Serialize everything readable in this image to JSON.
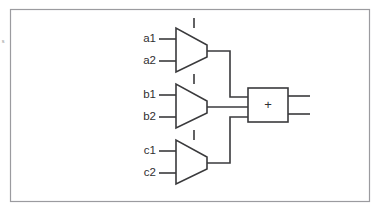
{
  "figure": {
    "kind": "digital-logic-schematic",
    "frame": {
      "border_color": "#9b9b9f",
      "background_color": "#ffffff",
      "x": 10,
      "y": 9,
      "width": 360,
      "height": 193
    },
    "line_color": "#3a3a3c",
    "margin_text": "s",
    "multiplexers": [
      {
        "name": "mux-a",
        "inputs": [
          {
            "label": "a1"
          },
          {
            "label": "a2"
          }
        ],
        "select_label": "",
        "output_label": ""
      },
      {
        "name": "mux-b",
        "inputs": [
          {
            "label": "b1"
          },
          {
            "label": "b2"
          }
        ],
        "select_label": "",
        "output_label": ""
      },
      {
        "name": "mux-c",
        "inputs": [
          {
            "label": "c1"
          },
          {
            "label": "c2"
          }
        ],
        "select_label": "",
        "output_label": ""
      }
    ],
    "adder": {
      "name": "adder",
      "symbol": "+",
      "input_count": 3,
      "output_count": 2
    }
  }
}
